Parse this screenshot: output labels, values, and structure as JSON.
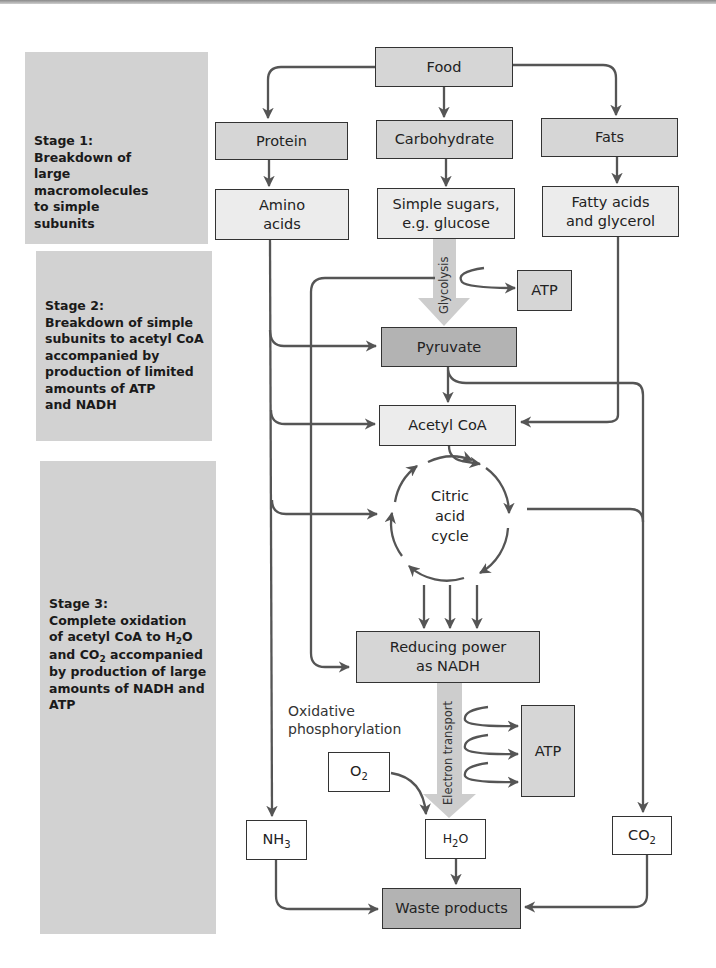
{
  "stages": [
    {
      "title": "Stage 1:",
      "lines": [
        "Breakdown of",
        "large",
        "macromolecules",
        "to simple",
        "subunits"
      ]
    },
    {
      "title": "Stage 2:",
      "lines": [
        "Breakdown of simple",
        "subunits to acetyl CoA",
        "accompanied by",
        "production of limited",
        "amounts of ATP",
        "and NADH"
      ]
    },
    {
      "title": "Stage 3:",
      "lines": [
        "Complete oxidation",
        "of acetyl CoA to H",
        "and CO",
        "by production of large",
        "amounts of NADH and",
        "ATP"
      ],
      "line2_sub": "2",
      "line2_tail": "O",
      "line3_sub": "2",
      "line3_tail": " accompanied"
    }
  ],
  "nodes": {
    "food": "Food",
    "protein": "Protein",
    "carbohydrate": "Carbohydrate",
    "fats": "Fats",
    "amino_acids": [
      "Amino",
      "acids"
    ],
    "simple_sugars": [
      "Simple sugars,",
      "e.g. glucose"
    ],
    "fatty_acids": [
      "Fatty acids",
      "and glycerol"
    ],
    "atp_glycolysis": "ATP",
    "pyruvate": "Pyruvate",
    "acetyl_coa": "Acetyl CoA",
    "citric_cycle": [
      "Citric",
      "acid",
      "cycle"
    ],
    "nadh": [
      "Reducing power",
      "as NADH"
    ],
    "atp_oxidative": "ATP",
    "o2": {
      "base": "O",
      "sub": "2"
    },
    "h2o": {
      "base": "H",
      "sub": "2",
      "tail": "O"
    },
    "nh3": {
      "base": "NH",
      "sub": "3"
    },
    "co2": {
      "base": "CO",
      "sub": "2"
    },
    "waste": "Waste products"
  },
  "labels": {
    "glycolysis": "Glycolysis",
    "electron_transport": "Electron transport",
    "oxidative": [
      "Oxidative",
      "phosphorylation"
    ]
  },
  "colors": {
    "stage_bg": "#d2d2d2",
    "box_dark": "#d6d6d6",
    "box_light": "#ececec",
    "box_darker": "#b3b3b3",
    "arrow": "#555555",
    "wide_arrow": "#cccccc"
  }
}
